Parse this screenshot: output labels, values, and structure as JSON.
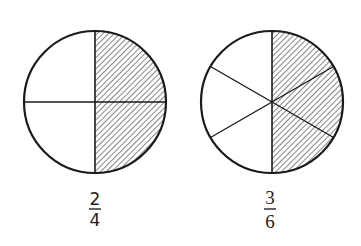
{
  "figures": [
    {
      "id": "halves-quarters",
      "total_parts": 4,
      "shaded_parts": 2,
      "fraction": {
        "numerator": "2",
        "denominator": "4"
      },
      "shaded_region": "right half"
    },
    {
      "id": "sixths",
      "total_parts": 6,
      "shaded_parts": 3,
      "fraction": {
        "numerator": "3",
        "denominator": "6"
      },
      "shaded_region": "right half"
    }
  ],
  "colors": {
    "stroke": "#1a1a1a",
    "hatch": "#444444",
    "background": "#ffffff"
  }
}
